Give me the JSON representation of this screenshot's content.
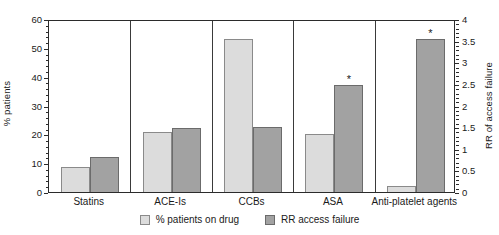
{
  "chart_data": {
    "type": "bar",
    "title": "",
    "subtitle": "",
    "xlabel": "",
    "ylabel": "% patients",
    "y2label": "RR of access failure",
    "ylim": [
      0,
      60
    ],
    "y2lim": [
      0,
      4
    ],
    "grid": false,
    "legend_position": "bottom-center",
    "panelled": true,
    "categories": [
      "Statins",
      "ACE-Is",
      "CCBs",
      "ASA",
      "Anti-platelet agents"
    ],
    "series": [
      {
        "name": "% patients on drug",
        "axis": "left",
        "color": "#dcdcdc",
        "values": [
          8.7,
          20.8,
          53.0,
          20.0,
          2.0
        ]
      },
      {
        "name": "RR access failure",
        "axis": "right",
        "color": "#a2a2a2",
        "values": [
          0.82,
          1.47,
          1.5,
          2.48,
          3.54
        ]
      }
    ],
    "annotations": [
      {
        "category": "ASA",
        "series": "RR access failure",
        "marker": "*"
      },
      {
        "category": "Anti-platelet agents",
        "series": "RR access failure",
        "marker": "*"
      }
    ],
    "yticks_left": [
      "0",
      "10",
      "20",
      "30",
      "40",
      "50",
      "60"
    ],
    "yticks_right": [
      "0",
      "0.5",
      "1",
      "1.5",
      "2",
      "2.5",
      "3",
      "3.5",
      "4"
    ]
  },
  "legend": {
    "items": [
      {
        "label": "% patients on drug",
        "swatch": "light-gray-swatch"
      },
      {
        "label": "RR access failure",
        "swatch": "dark-gray-swatch"
      }
    ]
  }
}
